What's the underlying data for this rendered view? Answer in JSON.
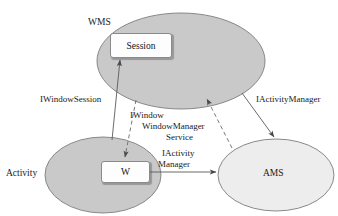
{
  "diagram": {
    "background_color": "#ffffff",
    "ellipse_fill_dark": "#c9c9c9",
    "ellipse_fill_light": "#ededed",
    "stroke_color": "#777777",
    "text_color": "#1a1a1a",
    "nodes": {
      "wms": {
        "label": "WMS",
        "shape": "ellipse",
        "fill": "#c9c9c9"
      },
      "activity": {
        "label": "Activity",
        "shape": "ellipse",
        "fill": "#c9c9c9"
      },
      "ams": {
        "label": "AMS",
        "shape": "ellipse",
        "fill": "#ededed"
      },
      "session": {
        "label": "Session",
        "shape": "rounded-rect",
        "fill": "#fdfdfd"
      },
      "w": {
        "label": "W",
        "shape": "rounded-rect",
        "fill": "#fdfdfd"
      }
    },
    "edges": {
      "window_session": {
        "label": "IWindowSession",
        "style": "solid",
        "from": "Activity",
        "to": "Session"
      },
      "iwindow": {
        "label": "IWindow",
        "style": "dashed",
        "from": "WMS",
        "to": "W"
      },
      "window_manager_service_line1": {
        "label": "WindowManager"
      },
      "window_manager_service_line2": {
        "label": "Service"
      },
      "iactivity_manager_right": {
        "label": "IActivityManager",
        "style": "solid",
        "from": "WMS",
        "to": "AMS"
      },
      "iactivity_line1": {
        "label": "IActivity"
      },
      "iactivity_line2": {
        "label": "Manager"
      }
    }
  }
}
